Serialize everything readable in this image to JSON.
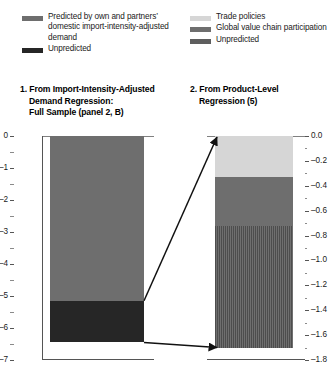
{
  "legend": {
    "left": [
      {
        "label": "Predicted by own and partners’ domestic import-intensity-adjusted demand",
        "color": "#6e6e6e",
        "key": "predicted"
      },
      {
        "label": "Unpredicted",
        "color": "#262626",
        "key": "unpredicted"
      }
    ],
    "right": [
      {
        "label": "Trade policies",
        "color": "#d6d6d6",
        "key": "trade-policies"
      },
      {
        "label": "Global value chain participation",
        "color": "#6e6e6e",
        "key": "gvc"
      },
      {
        "label": "Unpredicted",
        "color": "#5e5e5e",
        "key": "unpredicted"
      }
    ]
  },
  "panels": {
    "left": {
      "title_line1": "1. From Import-Intensity-Adjusted",
      "title_line2": "Demand Regression:",
      "title_line3": "Full Sample (panel 2, B)",
      "ticks": [
        "0",
        "–1",
        "–2",
        "–3",
        "–4",
        "–5",
        "–6",
        "–7"
      ]
    },
    "right": {
      "title_line1": "2. From Product-Level",
      "title_line2": "Regression (5)",
      "ticks": [
        "0.0",
        "–0.2",
        "–0.4",
        "–0.6",
        "–0.8",
        "–1.0",
        "–1.2",
        "–1.4",
        "–1.6",
        "–1.8"
      ]
    }
  },
  "chart_data": {
    "type": "bar",
    "title": "",
    "panels": [
      {
        "id": "panel-1",
        "title": "1. From Import-Intensity-Adjusted Demand Regression: Full Sample (panel 2, B)",
        "xlabel": "",
        "ylabel": "",
        "ylim": [
          -7,
          0
        ],
        "ytick_values": [
          0,
          -1,
          -2,
          -3,
          -4,
          -5,
          -6,
          -7
        ],
        "ytick_labels": [
          "0",
          "–1",
          "–2",
          "–3",
          "–4",
          "–5",
          "–6",
          "–7"
        ],
        "minor_tick_step": 0.5,
        "grid": false,
        "stacked": true,
        "categories": [
          ""
        ],
        "series": [
          {
            "name": "Predicted by own and partners’ domestic import-intensity-adjusted demand",
            "values": [
              -5.15
            ],
            "color": "#6e6e6e",
            "from": 0,
            "to": -5.15
          },
          {
            "name": "Unpredicted",
            "values": [
              -1.3
            ],
            "color": "#262626",
            "from": -5.15,
            "to": -6.45
          }
        ],
        "total": -6.45
      },
      {
        "id": "panel-2",
        "title": "2. From Product-Level Regression (5)",
        "xlabel": "",
        "ylabel": "",
        "ylim": [
          -1.8,
          0.0
        ],
        "ytick_values": [
          0.0,
          -0.2,
          -0.4,
          -0.6,
          -0.8,
          -1.0,
          -1.2,
          -1.4,
          -1.6,
          -1.8
        ],
        "ytick_labels": [
          "0.0",
          "–0.2",
          "–0.4",
          "–0.6",
          "–0.8",
          "–1.0",
          "–1.2",
          "–1.4",
          "–1.6",
          "–1.8"
        ],
        "minor_tick_step": 0.1,
        "grid": false,
        "stacked": true,
        "categories": [
          ""
        ],
        "series": [
          {
            "name": "Trade policies",
            "values": [
              -0.33
            ],
            "color": "#d6d6d6",
            "from": 0.0,
            "to": -0.33
          },
          {
            "name": "Global value chain participation",
            "values": [
              -0.39
            ],
            "color": "#6e6e6e",
            "from": -0.33,
            "to": -0.72
          },
          {
            "name": "Unpredicted",
            "values": [
              -0.98
            ],
            "color": "#5e5e5e",
            "pattern": "vertical-hatch",
            "from": -0.72,
            "to": -1.7
          }
        ],
        "total": -1.7
      }
    ],
    "annotations": [
      {
        "type": "arrow",
        "name": "arrow-unpredicted-top",
        "from_panel": "panel-1",
        "from_value": -5.15,
        "to_panel": "panel-2",
        "to_value": 0.0
      },
      {
        "type": "arrow",
        "name": "arrow-unpredicted-bottom",
        "from_panel": "panel-1",
        "from_value": -6.45,
        "to_panel": "panel-2",
        "to_value": -1.7
      }
    ],
    "legend_position": "top"
  }
}
